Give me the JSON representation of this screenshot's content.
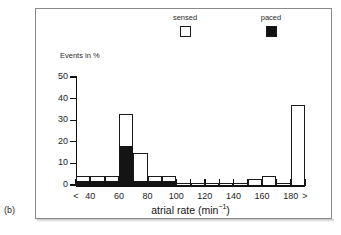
{
  "panel": {
    "label": "(b)"
  },
  "top_strip_text": "",
  "legend": {
    "items": [
      {
        "label": "sensed",
        "swatch": "open-square",
        "color": "#ffffff"
      },
      {
        "label": "paced",
        "swatch": "filled-square",
        "color": "#141414"
      }
    ]
  },
  "chart_data": {
    "type": "bar",
    "title": "",
    "subtitle": "",
    "xlabel": "atrial rate (min⁻¹)",
    "ylabel": "Events in %",
    "ylim": [
      0,
      50
    ],
    "yticks": [
      0,
      10,
      20,
      30,
      40,
      50
    ],
    "ytick_labels": [
      "0",
      "10",
      "20",
      "30",
      "40",
      "50"
    ],
    "xticks": [
      30,
      40,
      60,
      80,
      100,
      120,
      140,
      160,
      180,
      190
    ],
    "xtick_labels": [
      "<",
      "40",
      "60",
      "80",
      "100",
      "120",
      "140",
      "160",
      "180",
      ">"
    ],
    "xlim": [
      30,
      190
    ],
    "bin_width": 10,
    "grid": false,
    "legend_position": "top",
    "stacked": true,
    "bin_starts": [
      30,
      40,
      50,
      60,
      70,
      80,
      90,
      100,
      110,
      120,
      130,
      140,
      150,
      160,
      170,
      180
    ],
    "bin_labels": [
      "<40",
      "40-50",
      "50-60",
      "60-70",
      "70-80",
      "80-90",
      "90-100",
      "100-110",
      "110-120",
      "120-130",
      "130-140",
      "140-150",
      "150-160",
      "160-170",
      "170-180",
      "180>"
    ],
    "series": [
      {
        "name": "sensed",
        "color": "#ffffff",
        "values": [
          4,
          4,
          4,
          33,
          15,
          4,
          4,
          1,
          1,
          1,
          1,
          1,
          3,
          4,
          1,
          37
        ]
      },
      {
        "name": "paced",
        "color": "#141414",
        "values": [
          2,
          2,
          2,
          18,
          2,
          2,
          2,
          0,
          0,
          0,
          0,
          0,
          0,
          0,
          0,
          0
        ]
      }
    ],
    "annotations": []
  }
}
